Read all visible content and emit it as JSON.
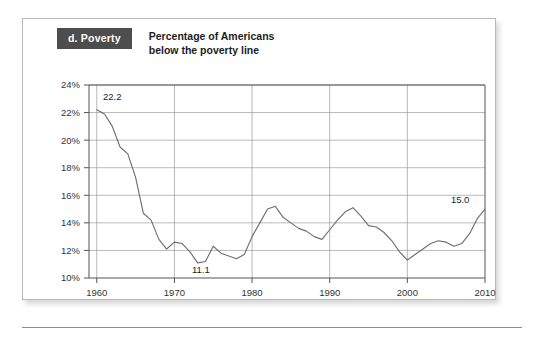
{
  "figure": {
    "panel_badge": "d. Poverty",
    "title": "Percentage of Americans\nbelow the poverty line",
    "badge_bg_color": "#4d4d4d",
    "badge_text_color": "#ffffff",
    "line_color": "#6f6f6f",
    "grid_color": "#9a9a9a"
  },
  "chart_data": {
    "type": "line",
    "title": "Percentage of Americans below the poverty line",
    "xlabel": "",
    "ylabel": "",
    "xlim": [
      1959,
      2010
    ],
    "ylim": [
      10,
      24
    ],
    "ytick_labels": [
      "10%",
      "12%",
      "14%",
      "16%",
      "18%",
      "20%",
      "22%",
      "24%"
    ],
    "ytick_values": [
      10,
      12,
      14,
      16,
      18,
      20,
      22,
      24
    ],
    "xtick_labels": [
      "1960",
      "1970",
      "1980",
      "1990",
      "2000",
      "2010"
    ],
    "xtick_values": [
      1960,
      1970,
      1980,
      1990,
      2000,
      2010
    ],
    "grid": true,
    "legend": false,
    "annotations": [
      {
        "text": "22.2",
        "x": 1962.0,
        "y": 22.9
      },
      {
        "text": "11.1",
        "x": 1973.4,
        "y": 10.35
      },
      {
        "text": "15.0",
        "x": 2006.8,
        "y": 15.45
      }
    ],
    "x": [
      1960,
      1961,
      1962,
      1963,
      1964,
      1965,
      1966,
      1967,
      1968,
      1969,
      1970,
      1971,
      1972,
      1973,
      1974,
      1975,
      1976,
      1977,
      1978,
      1979,
      1980,
      1981,
      1982,
      1983,
      1984,
      1985,
      1986,
      1987,
      1988,
      1989,
      1990,
      1991,
      1992,
      1993,
      1994,
      1995,
      1996,
      1997,
      1998,
      1999,
      2000,
      2001,
      2002,
      2003,
      2004,
      2005,
      2006,
      2007,
      2008,
      2009,
      2010
    ],
    "values": [
      22.2,
      21.9,
      21.0,
      19.5,
      19.0,
      17.3,
      14.7,
      14.2,
      12.8,
      12.1,
      12.6,
      12.5,
      11.9,
      11.1,
      11.2,
      12.3,
      11.8,
      11.6,
      11.4,
      11.7,
      13.0,
      14.0,
      15.0,
      15.2,
      14.4,
      14.0,
      13.6,
      13.4,
      13.0,
      12.8,
      13.5,
      14.2,
      14.8,
      15.1,
      14.5,
      13.8,
      13.7,
      13.3,
      12.7,
      11.9,
      11.3,
      11.7,
      12.1,
      12.5,
      12.7,
      12.6,
      12.3,
      12.5,
      13.2,
      14.3,
      15.0
    ]
  }
}
